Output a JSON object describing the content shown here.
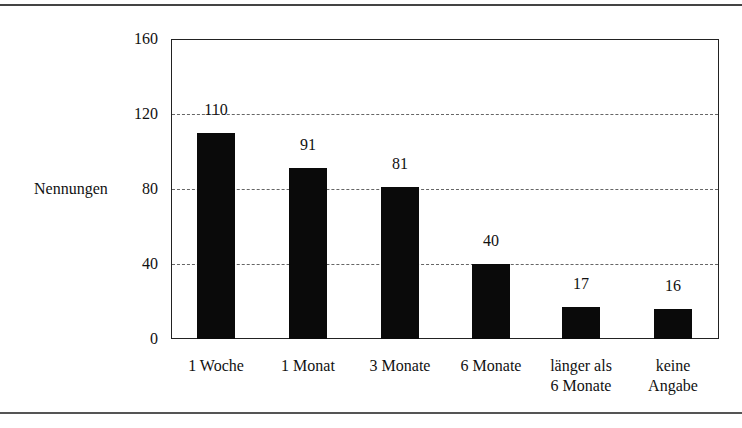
{
  "chart_data": {
    "type": "bar",
    "title": "",
    "xlabel": "",
    "ylabel": "Nennungen",
    "ylim": [
      0,
      160
    ],
    "yticks": [
      "0",
      "40",
      "80",
      "120",
      "160"
    ],
    "grid": true,
    "legend": null,
    "categories": [
      "1 Woche",
      "1 Monat",
      "3 Monate",
      "6 Monate",
      "länger als 6 Monate",
      "keine Angabe"
    ],
    "category_lines": [
      [
        "1 Woche",
        ""
      ],
      [
        "1 Monat",
        ""
      ],
      [
        "3 Monate",
        ""
      ],
      [
        "6 Monate",
        ""
      ],
      [
        "länger als",
        "6 Monate"
      ],
      [
        "keine",
        "Angabe"
      ]
    ],
    "values": [
      110,
      91,
      81,
      40,
      17,
      16
    ],
    "value_labels": [
      "110",
      "91",
      "81",
      "40",
      "17",
      "16"
    ],
    "bar_color": "#0a0a0a"
  }
}
